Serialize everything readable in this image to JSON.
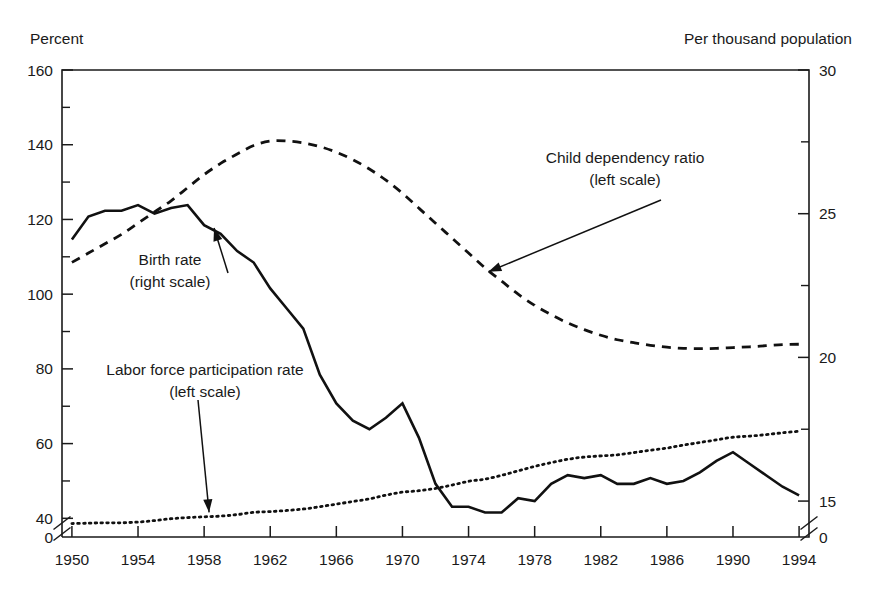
{
  "chart_data": {
    "type": "line",
    "title": "",
    "xlabel": "",
    "ylabel": "Percent",
    "y2label": "Per thousand population",
    "left_axis": {
      "label": "Percent",
      "lim": [
        35,
        160
      ],
      "ticks": [
        40,
        60,
        80,
        100,
        120,
        140,
        160
      ],
      "tick_labels": [
        "40",
        "60",
        "80",
        "100",
        "120",
        "140",
        "160"
      ],
      "minor_ticks": [
        50,
        70,
        90,
        110,
        130,
        150
      ],
      "zero_label": "0",
      "has_break": true
    },
    "right_axis": {
      "label": "Per thousand population",
      "lim": [
        13.75,
        30
      ],
      "ticks": [
        15,
        20,
        25,
        30
      ],
      "tick_labels": [
        "15",
        "20",
        "25",
        "30"
      ],
      "minor_ticks": [
        13.75,
        17.5,
        22.5,
        27.5
      ],
      "zero_label": "0",
      "has_break": true
    },
    "x": [
      1950,
      1951,
      1952,
      1953,
      1954,
      1955,
      1956,
      1957,
      1958,
      1959,
      1960,
      1961,
      1962,
      1963,
      1964,
      1965,
      1966,
      1967,
      1968,
      1969,
      1970,
      1971,
      1972,
      1973,
      1974,
      1975,
      1976,
      1977,
      1978,
      1979,
      1980,
      1981,
      1982,
      1983,
      1984,
      1985,
      1986,
      1987,
      1988,
      1989,
      1990,
      1991,
      1992,
      1993,
      1994
    ],
    "xlim": [
      1949.4,
      1994.6
    ],
    "xticks": [
      1950,
      1954,
      1958,
      1962,
      1966,
      1970,
      1974,
      1978,
      1982,
      1986,
      1990,
      1994
    ],
    "xtick_labels": [
      "1950",
      "1954",
      "1958",
      "1962",
      "1966",
      "1970",
      "1974",
      "1978",
      "1982",
      "1986",
      "1990",
      "1994"
    ],
    "grid": false,
    "legend": "inline-annotations",
    "series": [
      {
        "name": "Child dependency ratio",
        "scale": "left",
        "style": "dashed",
        "annotation": "Child dependency ratio",
        "annotation_sub": "(left scale)",
        "values": [
          108.5,
          111.0,
          113.5,
          116.0,
          119.0,
          122.0,
          125.0,
          128.5,
          132.0,
          135.0,
          137.5,
          139.8,
          141.0,
          141.0,
          140.5,
          139.5,
          138.0,
          136.0,
          133.5,
          130.5,
          127.0,
          123.0,
          119.0,
          115.0,
          111.0,
          107.0,
          103.5,
          100.0,
          97.0,
          94.5,
          92.3,
          90.5,
          89.0,
          87.8,
          87.0,
          86.3,
          85.8,
          85.5,
          85.4,
          85.5,
          85.7,
          85.9,
          86.2,
          86.5,
          86.6
        ]
      },
      {
        "name": "Labor force participation rate",
        "scale": "left",
        "style": "dotted",
        "annotation": "Labor force participation rate",
        "annotation_sub": "(left scale)",
        "values": [
          38.6,
          38.7,
          38.8,
          38.8,
          39.0,
          39.4,
          39.9,
          40.2,
          40.4,
          40.6,
          41.0,
          41.6,
          41.8,
          42.1,
          42.5,
          43.1,
          43.8,
          44.5,
          45.2,
          46.2,
          47.0,
          47.4,
          48.0,
          48.9,
          49.9,
          50.5,
          51.5,
          52.7,
          53.9,
          54.9,
          55.8,
          56.4,
          56.7,
          57.0,
          57.6,
          58.2,
          58.8,
          59.6,
          60.3,
          61.0,
          61.7,
          62.0,
          62.4,
          62.9,
          63.3
        ]
      },
      {
        "name": "Birth rate",
        "scale": "right",
        "style": "solid",
        "annotation": "Birth rate",
        "annotation_sub": "(right scale)",
        "values": [
          24.1,
          24.9,
          25.1,
          25.1,
          25.3,
          25.0,
          25.2,
          25.3,
          24.6,
          24.3,
          23.7,
          23.3,
          22.4,
          21.7,
          21.0,
          19.4,
          18.4,
          17.8,
          17.5,
          17.9,
          18.4,
          17.2,
          15.6,
          14.8,
          14.8,
          14.6,
          14.6,
          15.1,
          15.0,
          15.6,
          15.9,
          15.8,
          15.9,
          15.6,
          15.6,
          15.8,
          15.6,
          15.7,
          16.0,
          16.4,
          16.7,
          16.3,
          15.9,
          15.5,
          15.2
        ]
      }
    ],
    "annotations": [
      {
        "text": "Child dependency ratio",
        "subtext": "(left scale)",
        "target_x": 1975.2,
        "target_y_left": 106.0
      },
      {
        "text": "Birth rate",
        "subtext": "(right scale)",
        "target_x": 1958.6,
        "target_y_right": 24.5
      },
      {
        "text": "Labor force participation rate",
        "subtext": "(left scale)",
        "target_x": 1958.3,
        "target_y_left": 41.6
      }
    ]
  }
}
